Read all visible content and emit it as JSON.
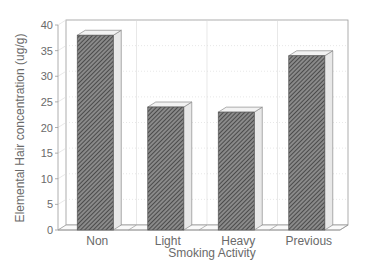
{
  "chart_data": {
    "type": "bar",
    "style": "3d-hatched",
    "title": "",
    "xlabel": "Smoking Activity",
    "ylabel": "Elemental Hair concentration (ug/g)",
    "categories": [
      "Non",
      "Light",
      "Heavy",
      "Previous"
    ],
    "values": [
      38,
      24,
      23,
      34
    ],
    "ylim": [
      0,
      40
    ],
    "yticks": [
      0,
      5,
      10,
      15,
      20,
      25,
      30,
      35,
      40
    ],
    "grid": true,
    "legend": null
  },
  "colors": {
    "bar_fill": "#5a5a5a",
    "bar_side": "#e8e8e8",
    "axis": "#9a9a9a",
    "grid": "#d8d8d8",
    "text": "#6a6a6a"
  }
}
